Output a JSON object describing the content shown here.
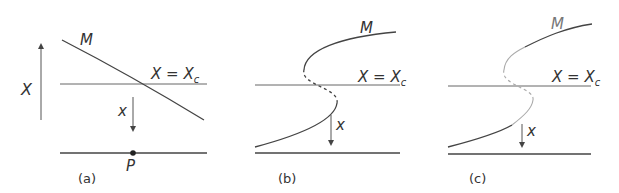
{
  "panels": [
    {
      "id": "a",
      "caption": "(a)",
      "curve_label": "M",
      "threshold_label": "X = X",
      "threshold_sub": "c",
      "arrow_label": "x",
      "point_label": "P",
      "axis_label": "X"
    },
    {
      "id": "b",
      "caption": "(b)",
      "curve_label": "M",
      "threshold_label": "X = X",
      "threshold_sub": "c",
      "arrow_label": "x"
    },
    {
      "id": "c",
      "caption": "(c)",
      "curve_label": "M",
      "threshold_label": "X = X",
      "threshold_sub": "c",
      "arrow_label": "x"
    }
  ],
  "colors": {
    "line": "#444444",
    "light": "#999999"
  }
}
